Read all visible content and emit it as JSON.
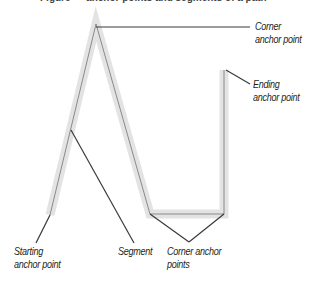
{
  "figure": {
    "caption_clipped": "Figure — anchor points and segments of a path"
  },
  "path": {
    "points": [
      [
        50,
        215
      ],
      [
        96,
        24
      ],
      [
        150,
        214
      ],
      [
        224,
        214
      ],
      [
        224,
        70
      ]
    ],
    "highlight_color": "#e3e3e3",
    "stroke_color": "#8a8a8a"
  },
  "leaders": [
    {
      "from": [
        96,
        27
      ],
      "to": [
        250,
        27
      ]
    },
    {
      "from": [
        226,
        70
      ],
      "to": [
        250,
        84
      ]
    },
    {
      "from": [
        50,
        215
      ],
      "to": [
        36,
        243
      ]
    },
    {
      "from": [
        71,
        130
      ],
      "to": [
        134,
        243
      ]
    },
    {
      "from": [
        150,
        214
      ],
      "to": [
        189,
        242
      ]
    },
    {
      "from": [
        224,
        214
      ],
      "to": [
        189,
        242
      ]
    }
  ],
  "labels": {
    "corner_top": [
      "Corner",
      "anchor point"
    ],
    "ending": [
      "Ending",
      "anchor point"
    ],
    "starting": [
      "Starting",
      "anchor point"
    ],
    "segment": "Segment",
    "corner_bottom": [
      "Corner anchor",
      "points"
    ]
  }
}
